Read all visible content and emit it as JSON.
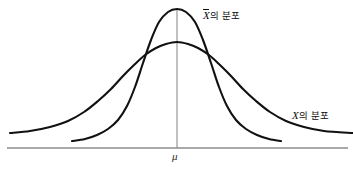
{
  "figure": {
    "type": "statistics-diagram",
    "title": "",
    "background_color": "#ffffff",
    "curve_color": "#111111",
    "axis_color": "#8c8c8c"
  },
  "labels": {
    "xbar_distribution": {
      "variable": "X",
      "has_overbar": true,
      "suffix": "의 분포",
      "full_text": "X̄의 분포"
    },
    "x_distribution": {
      "variable": "X",
      "has_overbar": false,
      "suffix": "의 분포",
      "full_text": "X의 분포"
    },
    "mean_marker": "μ"
  },
  "chart_data": {
    "type": "line",
    "title": "",
    "xlabel": "",
    "ylabel": "",
    "grid": false,
    "legend_position": "inline-annotation",
    "axis": {
      "baseline_y_px": 148,
      "baseline_x_start_px": 7,
      "baseline_x_end_px": 348,
      "mean_x_px": 177,
      "mean_line_top_px": 9,
      "mean_line_bottom_px": 148
    },
    "series": [
      {
        "name": "X̄의 분포",
        "description": "Sampling distribution of the sample mean — narrow and tall",
        "mean": 0,
        "sigma": 1,
        "peak_x_px": 177,
        "peak_y_px": 9,
        "x_start_px": 72,
        "x_end_px": 281,
        "tail_y_px": 141,
        "points": [
          [
            72,
            141
          ],
          [
            85,
            139
          ],
          [
            97,
            135
          ],
          [
            108,
            129
          ],
          [
            118,
            120
          ],
          [
            127,
            106
          ],
          [
            135,
            87
          ],
          [
            143,
            63
          ],
          [
            151,
            40
          ],
          [
            159,
            22
          ],
          [
            168,
            12
          ],
          [
            177,
            9
          ],
          [
            186,
            12
          ],
          [
            195,
            22
          ],
          [
            203,
            40
          ],
          [
            211,
            63
          ],
          [
            219,
            87
          ],
          [
            227,
            106
          ],
          [
            236,
            120
          ],
          [
            246,
            129
          ],
          [
            257,
            135
          ],
          [
            269,
            139
          ],
          [
            281,
            141
          ]
        ]
      },
      {
        "name": "X의 분포",
        "description": "Population distribution of X — wide and flat",
        "mean": 0,
        "sigma": 2.4,
        "peak_x_px": 177,
        "peak_y_px": 42,
        "x_start_px": 10,
        "x_end_px": 353,
        "tail_y_px": 133,
        "points": [
          [
            10,
            133
          ],
          [
            30,
            131
          ],
          [
            50,
            127
          ],
          [
            68,
            121
          ],
          [
            84,
            112
          ],
          [
            98,
            101
          ],
          [
            111,
            89
          ],
          [
            123,
            76
          ],
          [
            134,
            65
          ],
          [
            145,
            55
          ],
          [
            156,
            48
          ],
          [
            166,
            44
          ],
          [
            177,
            42
          ],
          [
            188,
            44
          ],
          [
            198,
            48
          ],
          [
            209,
            55
          ],
          [
            220,
            65
          ],
          [
            231,
            76
          ],
          [
            243,
            89
          ],
          [
            256,
            101
          ],
          [
            270,
            112
          ],
          [
            286,
            121
          ],
          [
            304,
            127
          ],
          [
            324,
            131
          ],
          [
            353,
            133
          ]
        ]
      }
    ],
    "annotations": [
      {
        "text": "X̄의 분포",
        "x_px": 203,
        "y_px": 9
      },
      {
        "text": "X의 분포",
        "x_px": 292,
        "y_px": 110
      },
      {
        "text": "μ",
        "x_px": 172,
        "y_px": 151
      }
    ],
    "crossing_points": [
      {
        "x_px": 133,
        "y_px": 57
      },
      {
        "x_px": 221,
        "y_px": 57
      }
    ]
  }
}
